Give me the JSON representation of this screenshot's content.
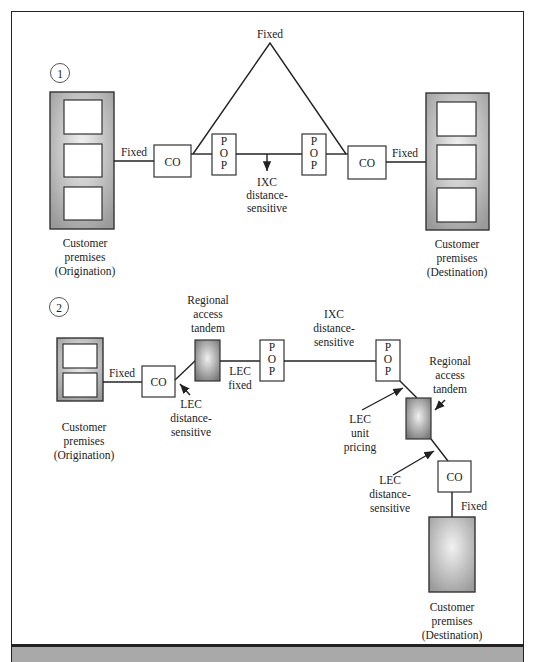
{
  "diagram": {
    "type": "network-pricing-diagram",
    "colors": {
      "line": "#222222",
      "premises_fill": "#b5b5b5",
      "tandem_fill": "#8a8a8a",
      "bottom_bar": "#a9a9a9"
    },
    "scenario1": {
      "number": "1",
      "top_label": "Fixed",
      "left_premises": [
        "Customer",
        "premises",
        "(Origination)"
      ],
      "right_premises": [
        "Customer",
        "premises",
        "(Destination)"
      ],
      "left_link": "Fixed",
      "right_link": "Fixed",
      "co_left": "CO",
      "co_right": "CO",
      "pop_left": [
        "P",
        "O",
        "P"
      ],
      "pop_right": [
        "P",
        "O",
        "P"
      ],
      "ixc_label": [
        "IXC",
        "distance-",
        "sensitive"
      ]
    },
    "scenario2": {
      "number": "2",
      "left_premises": [
        "Customer",
        "premises",
        "(Origination)"
      ],
      "left_link": "Fixed",
      "co_left": "CO",
      "tandem_left_label": [
        "Regional",
        "access",
        "tandem"
      ],
      "lec_distance_left": [
        "LEC",
        "distance-",
        "sensitive"
      ],
      "lec_fixed": [
        "LEC",
        "fixed"
      ],
      "pop_left": [
        "P",
        "O",
        "P"
      ],
      "ixc_label": [
        "IXC",
        "distance-",
        "sensitive"
      ],
      "pop_right": [
        "P",
        "O",
        "P"
      ],
      "tandem_right_label": [
        "Regional",
        "access",
        "tandem"
      ],
      "lec_unit_pricing": [
        "LEC",
        "unit",
        "pricing"
      ],
      "lec_distance_right": [
        "LEC",
        "distance-",
        "sensitive"
      ],
      "co_right": "CO",
      "right_link": "Fixed",
      "right_premises": [
        "Customer",
        "premises",
        "(Destination)"
      ]
    }
  }
}
